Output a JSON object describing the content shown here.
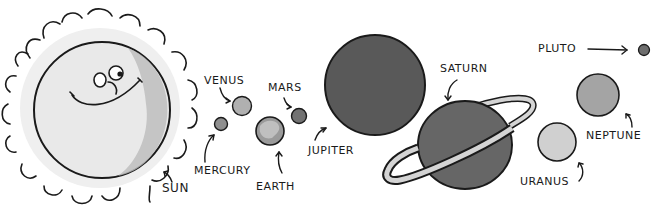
{
  "illustration": {
    "title": "Solar System",
    "style": "hand-drawn grayscale cartoon",
    "bodies": [
      {
        "name": "sun",
        "label": "SUN",
        "fill": "#e6e6e6",
        "shade": "#bdbdbd"
      },
      {
        "name": "mercury",
        "label": "MERCURY",
        "fill": "#8f8f8f"
      },
      {
        "name": "venus",
        "label": "VENUS",
        "fill": "#b0b0b0"
      },
      {
        "name": "earth",
        "label": "EARTH",
        "fill": "#9a9a9a",
        "land": "#cfcfcf"
      },
      {
        "name": "mars",
        "label": "MARS",
        "fill": "#727272"
      },
      {
        "name": "jupiter",
        "label": "JUPITER",
        "fill": "#595959"
      },
      {
        "name": "saturn",
        "label": "SATURN",
        "fill": "#666666",
        "ring": "#d4d4d4"
      },
      {
        "name": "uranus",
        "label": "URANUS",
        "fill": "#d0d0d0"
      },
      {
        "name": "neptune",
        "label": "NEPTUNE",
        "fill": "#a4a4a4"
      },
      {
        "name": "pluto",
        "label": "PLUTO",
        "fill": "#6e6e6e"
      }
    ],
    "ink_color": "#1a1a1a"
  }
}
